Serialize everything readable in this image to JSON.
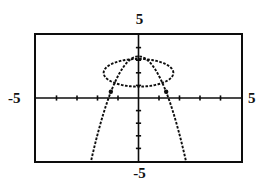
{
  "screen": {
    "kind": "graphing-calculator-screen",
    "width": 259,
    "height": 186,
    "background_color": "#ffffff",
    "ink_color": "#0d0d0d"
  },
  "labels": {
    "ymax": "5",
    "ymin": "-5",
    "xmin": "-5",
    "xmax": "5"
  },
  "chart_data": {
    "type": "line",
    "title": "",
    "subtitle": "",
    "xlabel": "",
    "ylabel": "",
    "xlim": [
      -5,
      5
    ],
    "ylim": [
      -5,
      5
    ],
    "grid": false,
    "legend": "none",
    "axes": {
      "x_axis_drawn": true,
      "y_axis_drawn": true,
      "x_tick_spacing": 1,
      "y_tick_spacing": 1,
      "x_tick_values": [
        -4,
        -3,
        -2,
        -1,
        1,
        2,
        3,
        4
      ],
      "y_tick_values": [
        -4,
        -3,
        -2,
        -1,
        1,
        2,
        3,
        4
      ],
      "tick_style": "short-marks",
      "axis_labels_shown": [
        "5",
        "-5",
        "-5",
        "5"
      ]
    },
    "render_style": "dotted-pixel-trace",
    "series": [
      {
        "name": "ellipse",
        "curve_type": "ellipse",
        "center": [
          0,
          2
        ],
        "semi_axis_x": 1.7,
        "semi_axis_y": 1.1,
        "equation": "x^2/2.89 + (y-2)^2/1.21 = 1",
        "closed": true
      },
      {
        "name": "downward-parabola",
        "curve_type": "parabola",
        "vertex": [
          0,
          3.3
        ],
        "opens": "down",
        "leading_coefficient": -1.55,
        "equation": "y = -1.55x^2 + 3.3"
      }
    ],
    "intersections": [
      {
        "x": -1.35,
        "y": 0.5,
        "marked": true
      },
      {
        "x": 1.35,
        "y": 0.5,
        "marked": true
      }
    ],
    "annotations": []
  }
}
